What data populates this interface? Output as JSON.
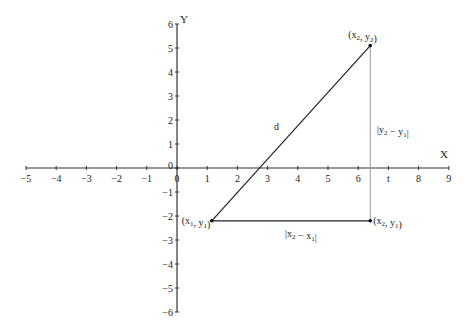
{
  "chart_data": {
    "type": "diagram",
    "title": "",
    "axes": {
      "x": {
        "label": "X",
        "min": -5,
        "max": 9,
        "ticks": [
          -5,
          -4,
          -3,
          -2,
          -1,
          0,
          1,
          2,
          3,
          4,
          5,
          6,
          7,
          8,
          9
        ],
        "tick_labels": [
          "−5",
          "−4",
          "−3",
          "−2",
          "−1",
          "0",
          "1",
          "2",
          "3",
          "4",
          "5",
          "6",
          "t",
          "8",
          "9"
        ]
      },
      "y": {
        "label": "Y",
        "min": -6,
        "max": 6,
        "ticks": [
          -6,
          -5,
          -4,
          -3,
          -2,
          -1,
          0,
          1,
          2,
          3,
          4,
          5,
          6
        ],
        "tick_labels": [
          "−6",
          "−5",
          "−4",
          "−3",
          "−2",
          "−1",
          "0",
          "1",
          "2",
          "3",
          "4",
          "5",
          "6"
        ]
      }
    },
    "points": [
      {
        "name": "P1",
        "x": 1.15,
        "y": -2.2,
        "label": "(x1, y1)"
      },
      {
        "name": "P2",
        "x": 6.4,
        "y": 5.1,
        "label": "(x2, y2)"
      },
      {
        "name": "P3",
        "x": 6.4,
        "y": -2.2,
        "label": "(x2, y1)"
      }
    ],
    "segments": [
      {
        "from": "P1",
        "to": "P2",
        "label": "d"
      },
      {
        "from": "P1",
        "to": "P3",
        "label": "|x2 − x1|"
      },
      {
        "from": "P3",
        "to": "P2",
        "label": "|y2 − y1|"
      }
    ],
    "grid": false
  },
  "labels": {
    "x_axis": "X",
    "y_axis": "Y",
    "distance": "d",
    "horizontal_leg": "|x2 − x1|",
    "vertical_leg": "|y2 − y1|",
    "p1": "(x1, y1)",
    "p2": "(x2, y2)",
    "p3": "(x2, y1)"
  }
}
